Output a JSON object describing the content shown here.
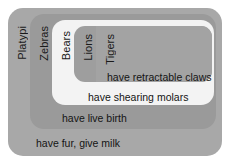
{
  "diagram": {
    "type": "nested-set-euler-diagram",
    "background_color": "#ffffff",
    "levels": [
      {
        "index": 0,
        "animal_label": "Platypi",
        "trait_label": "have fur, give milk",
        "fill_color": "#a8a8a8"
      },
      {
        "index": 1,
        "animal_label": "Zebras",
        "trait_label": "have live birth",
        "fill_color": "#9a9a9a"
      },
      {
        "index": 2,
        "animal_label": "Bears",
        "trait_label": "have shearing molars",
        "fill_color": "#f3f3f3"
      },
      {
        "index": 3,
        "animal_label": "Lions",
        "trait_label": "have retractable claws",
        "fill_color": "#9e9e9e"
      },
      {
        "index": 4,
        "animal_label": "Tigers",
        "trait_label": "",
        "fill_color": "#a3a3a3"
      }
    ]
  }
}
